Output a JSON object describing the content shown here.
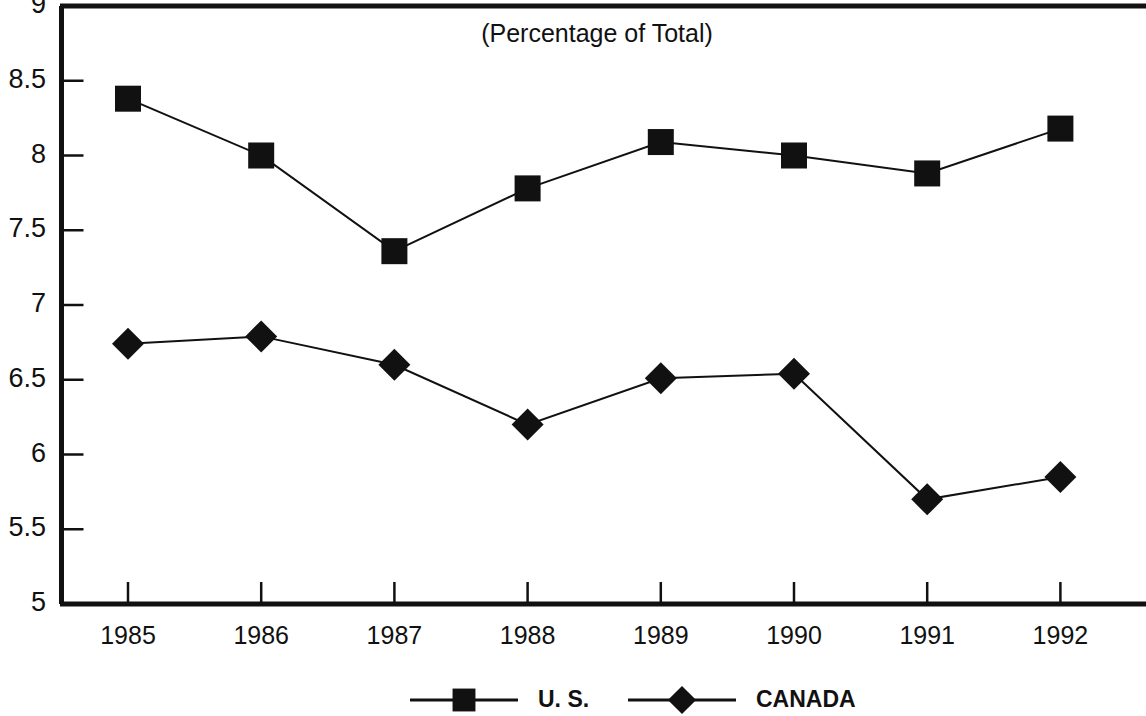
{
  "chart_data": {
    "type": "line",
    "title": "(Percentage of Total)",
    "xlabel": "",
    "ylabel": "",
    "categories": [
      "1985",
      "1986",
      "1987",
      "1988",
      "1989",
      "1990",
      "1991",
      "1992"
    ],
    "series": [
      {
        "name": "U. S.",
        "marker": "square",
        "color": "#111111",
        "values": [
          8.38,
          8.0,
          7.36,
          7.78,
          8.09,
          8.0,
          7.88,
          8.18
        ]
      },
      {
        "name": "CANADA",
        "marker": "diamond",
        "color": "#111111",
        "values": [
          6.74,
          6.79,
          6.6,
          6.2,
          6.51,
          6.54,
          5.7,
          5.85
        ]
      }
    ],
    "ylim": [
      5,
      9
    ],
    "ytick_labels": [
      "9",
      "8.5",
      "8",
      "7.5",
      "7",
      "6.5",
      "6",
      "5.5",
      "5"
    ],
    "ytick_values": [
      9,
      8.5,
      8,
      7.5,
      7,
      6.5,
      6,
      5.5,
      5
    ],
    "grid": false,
    "legend_position": "bottom"
  },
  "legend": {
    "entries": [
      {
        "label": "U. S.",
        "marker": "square"
      },
      {
        "label": "CANADA",
        "marker": "diamond"
      }
    ]
  }
}
